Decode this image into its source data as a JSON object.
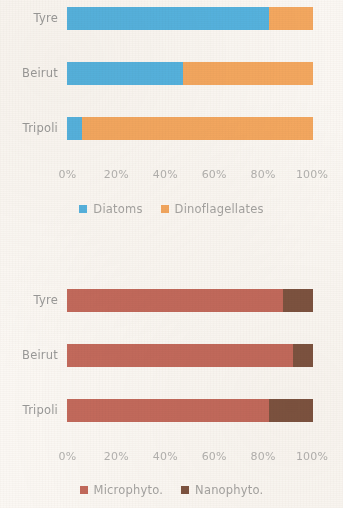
{
  "chart_data": [
    {
      "type": "bar",
      "orientation": "horizontal",
      "stacked": true,
      "normalized": "percent",
      "title": "",
      "xlabel": "",
      "ylabel": "",
      "categories": [
        "Tyre",
        "Beirut",
        "Tripoli"
      ],
      "tick_labels": [
        "0%",
        "20%",
        "40%",
        "60%",
        "80%",
        "100%"
      ],
      "tick_values": [
        0,
        20,
        40,
        60,
        80,
        100
      ],
      "xlim": [
        0,
        100
      ],
      "grid": false,
      "legend_position": "bottom",
      "series": [
        {
          "name": "Diatoms",
          "color": "#56b3e0",
          "values": [
            82,
            47,
            6
          ]
        },
        {
          "name": "Dinoflagellates",
          "color": "#f4a860",
          "values": [
            18,
            53,
            94
          ]
        }
      ]
    },
    {
      "type": "bar",
      "orientation": "horizontal",
      "stacked": true,
      "normalized": "percent",
      "title": "",
      "xlabel": "",
      "ylabel": "",
      "categories": [
        "Tyre",
        "Beirut",
        "Tripoli"
      ],
      "tick_labels": [
        "0%",
        "20%",
        "40%",
        "60%",
        "80%",
        "100%"
      ],
      "tick_values": [
        0,
        20,
        40,
        60,
        80,
        100
      ],
      "xlim": [
        0,
        100
      ],
      "grid": false,
      "legend_position": "bottom",
      "series": [
        {
          "name": "Microphyto.",
          "color": "#c36a5c",
          "values": [
            88,
            92,
            82
          ]
        },
        {
          "name": "Nanophyto.",
          "color": "#7d5340",
          "values": [
            12,
            8,
            18
          ]
        }
      ]
    }
  ],
  "charts": [
    {
      "categories": [
        {
          "label": "Tyre"
        },
        {
          "label": "Beirut"
        },
        {
          "label": "Tripoli"
        }
      ],
      "ticks": [
        {
          "label": "0%"
        },
        {
          "label": "20%"
        },
        {
          "label": "40%"
        },
        {
          "label": "60%"
        },
        {
          "label": "80%"
        },
        {
          "label": "100%"
        }
      ],
      "legend": [
        {
          "label": "Diatoms"
        },
        {
          "label": "Dinoflagellates"
        }
      ]
    },
    {
      "categories": [
        {
          "label": "Tyre"
        },
        {
          "label": "Beirut"
        },
        {
          "label": "Tripoli"
        }
      ],
      "ticks": [
        {
          "label": "0%"
        },
        {
          "label": "20%"
        },
        {
          "label": "40%"
        },
        {
          "label": "60%"
        },
        {
          "label": "80%"
        },
        {
          "label": "100%"
        }
      ],
      "legend": [
        {
          "label": "Microphyto."
        },
        {
          "label": "Nanophyto."
        }
      ]
    }
  ]
}
